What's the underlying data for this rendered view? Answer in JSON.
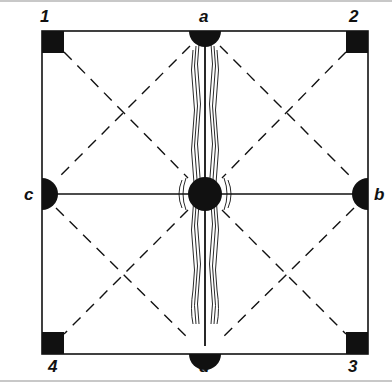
{
  "diagram": {
    "type": "square-frame-with-nodes",
    "corner_labels": [
      "1",
      "2",
      "3",
      "4"
    ],
    "midpoint_labels": [
      "a",
      "b",
      "c",
      "d"
    ],
    "corners": {
      "1": "top-left",
      "2": "top-right",
      "3": "bottom-right",
      "4": "bottom-left"
    },
    "midpoints": {
      "a": "top",
      "b": "right",
      "c": "left",
      "d": "bottom"
    },
    "lines": {
      "solid": [
        "square outline",
        "c-b horizontal",
        "a-d vertical (wavy hatched)"
      ],
      "dashed": [
        "1-center diagonal region",
        "a-c",
        "a-b",
        "c-d",
        "b-d",
        "1-3 diagonal",
        "2-4 diagonal"
      ]
    },
    "colors": {
      "ink": "#111111",
      "background": "#ffffff",
      "frame": "#c8c8c8"
    }
  },
  "labels": {
    "one": "1",
    "two": "2",
    "three": "3",
    "four": "4",
    "a": "a",
    "b": "b",
    "c": "c",
    "d": "d"
  }
}
